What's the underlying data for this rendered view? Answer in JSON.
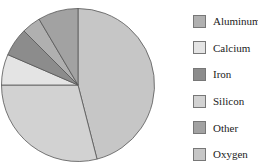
{
  "chart_data": {
    "type": "pie",
    "title": "",
    "start_angle_deg": 0,
    "direction": "clockwise",
    "slices": [
      {
        "label": "Oxygen",
        "value": 46,
        "color": "#c6c6c6"
      },
      {
        "label": "Silicon",
        "value": 29,
        "color": "#d2d2d2"
      },
      {
        "label": "Calcium",
        "value": 6.5,
        "color": "#e4e4e4"
      },
      {
        "label": "Iron",
        "value": 6,
        "color": "#8c8c8c"
      },
      {
        "label": "Aluminum",
        "value": 4,
        "color": "#b0b0b0"
      },
      {
        "label": "Other",
        "value": 8.5,
        "color": "#a2a2a2"
      }
    ],
    "legend": {
      "position": "right",
      "entries": [
        "Aluminum",
        "Calcium",
        "Iron",
        "Silicon",
        "Other",
        "Oxygen"
      ]
    }
  },
  "legend": {
    "items": [
      {
        "label": "Aluminum",
        "color": "#b0b0b0"
      },
      {
        "label": "Calcium",
        "color": "#e4e4e4"
      },
      {
        "label": "Iron",
        "color": "#8c8c8c"
      },
      {
        "label": "Silicon",
        "color": "#d2d2d2"
      },
      {
        "label": "Other",
        "color": "#a2a2a2"
      },
      {
        "label": "Oxygen",
        "color": "#c6c6c6"
      }
    ]
  }
}
